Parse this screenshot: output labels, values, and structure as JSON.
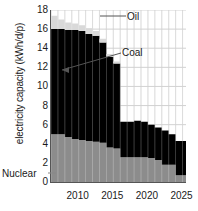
{
  "chart_data": {
    "type": "area",
    "title": "",
    "xlabel": "",
    "ylabel": "electricity capacity (kWh/d/p)",
    "xlim": [
      2006,
      2025.5
    ],
    "ylim": [
      0,
      18
    ],
    "ytick_labels": [
      "0",
      "2",
      "4",
      "6",
      "8",
      "10",
      "12",
      "14",
      "16",
      "18"
    ],
    "ytick_values": [
      0,
      2,
      4,
      6,
      8,
      10,
      12,
      14,
      16,
      18
    ],
    "xtick_labels": [
      "2010",
      "2015",
      "2020",
      "2025"
    ],
    "xtick_values": [
      2010,
      2015,
      2020,
      2025
    ],
    "grid": true,
    "stacked": true,
    "legend_position": "inline-annotations",
    "x": [
      2006,
      2007,
      2008,
      2009,
      2010,
      2011,
      2012,
      2013,
      2014,
      2015,
      2016,
      2017,
      2018,
      2019,
      2020,
      2021,
      2022,
      2023,
      2024,
      2025
    ],
    "series": [
      {
        "name": "Nuclear",
        "color": "#8c8c8c",
        "values": [
          5.0,
          5.0,
          4.7,
          4.5,
          4.4,
          4.3,
          4.2,
          4.1,
          3.6,
          3.5,
          2.6,
          2.6,
          2.6,
          2.6,
          2.5,
          2.3,
          1.8,
          1.8,
          0.7,
          0.7
        ]
      },
      {
        "name": "Coal",
        "color": "#000000",
        "values": [
          11.0,
          11.0,
          11.2,
          11.4,
          11.4,
          11.2,
          11.1,
          10.5,
          9.5,
          8.9,
          3.7,
          3.7,
          3.8,
          3.7,
          3.5,
          3.4,
          3.6,
          3.2,
          3.6,
          3.6
        ]
      },
      {
        "name": "Oil",
        "color": "#d9d9d9",
        "values": [
          1.4,
          1.0,
          0.8,
          0.7,
          0.6,
          0.6,
          0.5,
          0.4,
          0.3,
          0.2,
          0.0,
          0.0,
          0.0,
          0.0,
          0.0,
          0.0,
          0.0,
          0.0,
          0.0,
          0.0
        ]
      }
    ],
    "annotations": [
      {
        "name": "oil-label",
        "text": "Oil"
      },
      {
        "name": "coal-label",
        "text": "Coal"
      },
      {
        "name": "nuclear-label",
        "text": "Nuclear"
      }
    ]
  }
}
